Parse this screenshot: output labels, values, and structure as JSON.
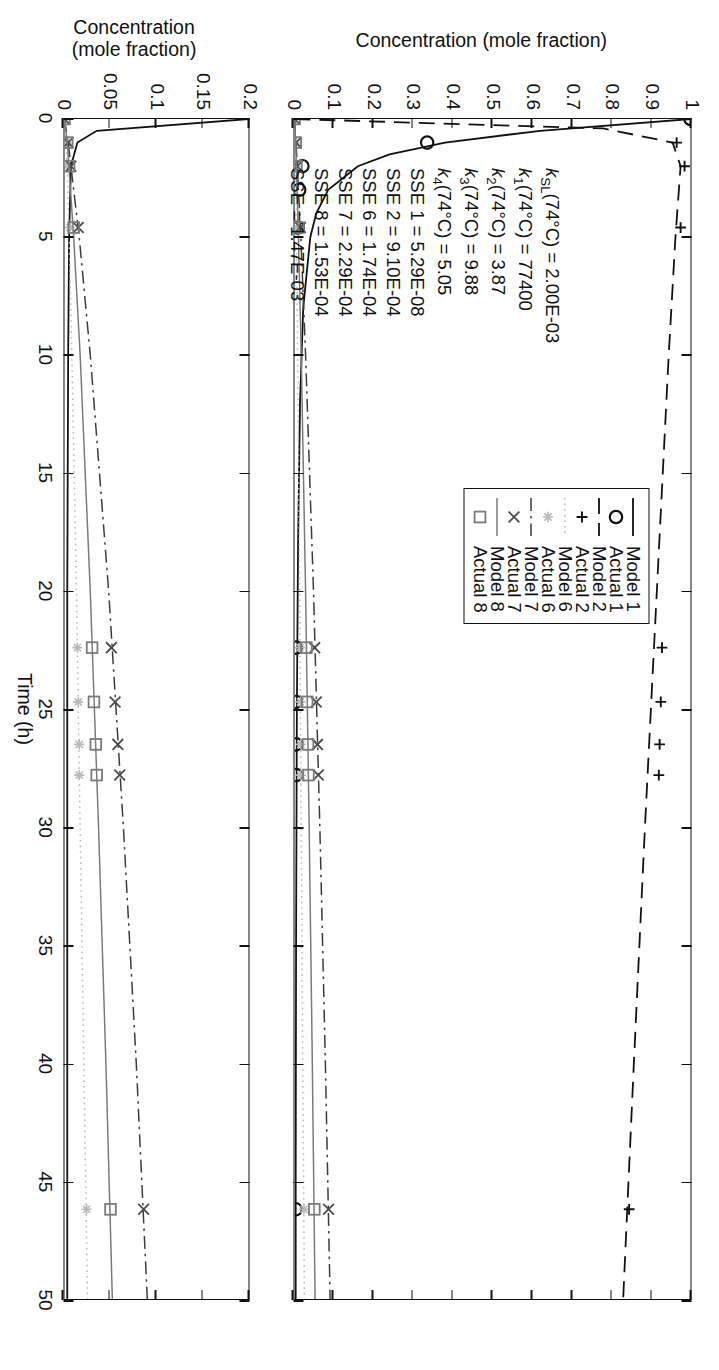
{
  "figure": {
    "xaxis_title": "Time (h)",
    "yaxis_title_top": "Concentration (mole fraction)",
    "yaxis_title_bottom_line1": "Concentration",
    "yaxis_title_bottom_line2": "(mole fraction)"
  },
  "legend": {
    "items": [
      {
        "label": "Model 1",
        "key": "solid-black-line"
      },
      {
        "label": "Actual 1",
        "key": "circle-marker"
      },
      {
        "label": "Model 2",
        "key": "dashed-line"
      },
      {
        "label": "Actual 2",
        "key": "plus-marker"
      },
      {
        "label": "Model 6",
        "key": "dotted-light-line"
      },
      {
        "label": "Actual 6",
        "key": "asterisk-marker"
      },
      {
        "label": "Model 7",
        "key": "dashdot-line"
      },
      {
        "label": "Actual 7",
        "key": "cross-marker"
      },
      {
        "label": "Model 8",
        "key": "solid-gray-line"
      },
      {
        "label": "Actual 8",
        "key": "square-marker"
      }
    ]
  },
  "annotation": {
    "lines": [
      {
        "symbol": "k",
        "sub": "SL",
        "rest": "(74°C) = 2.00E-03"
      },
      {
        "symbol": "k",
        "sub": "1",
        "rest": "(74°C) = 77400"
      },
      {
        "symbol": "k",
        "sub": "2",
        "rest": "(74°C) = 3.87"
      },
      {
        "symbol": "k",
        "sub": "3",
        "rest": "(74°C) = 9.88"
      },
      {
        "symbol": "k",
        "sub": "4",
        "rest": "(74°C) = 5.05"
      },
      {
        "symbol": "",
        "sub": "",
        "rest": "SSE 1 = 5.29E-08"
      },
      {
        "symbol": "",
        "sub": "",
        "rest": "SSE 2 = 9.10E-04"
      },
      {
        "symbol": "",
        "sub": "",
        "rest": "SSE 6 = 1.74E-04"
      },
      {
        "symbol": "",
        "sub": "",
        "rest": "SSE 7 = 2.29E-04"
      },
      {
        "symbol": "",
        "sub": "",
        "rest": "SSE 8 = 1.53E-04"
      },
      {
        "symbol": "",
        "sub": "",
        "rest": "SSE = 1.47E-03"
      }
    ]
  },
  "axes": {
    "x_ticks": [
      0,
      5,
      10,
      15,
      20,
      25,
      30,
      35,
      40,
      45,
      50
    ],
    "x_range": [
      0,
      50
    ],
    "y_ticks_top": [
      "0",
      "0.1",
      "0.2",
      "0.3",
      "0.4",
      "0.5",
      "0.6",
      "0.7",
      "0.8",
      "0.9",
      "1"
    ],
    "y_range_top": [
      0,
      1
    ],
    "y_ticks_bottom": [
      "0",
      "0.05",
      "0.1",
      "0.15",
      "0.2"
    ],
    "y_range_bottom": [
      0,
      0.2
    ]
  },
  "colors": {
    "ink": "#111111",
    "gray_mid": "#7a7a7a",
    "gray_light": "#b8b8b8",
    "axis": "#111111"
  },
  "chart_data": {
    "type": "line",
    "title": "",
    "xlabel": "Time (h)",
    "ylabel": "Concentration (mole fraction)",
    "xlim": [
      0,
      50
    ],
    "grid": false,
    "legend_position": "upper-center-right",
    "panels": [
      {
        "name": "top-panel",
        "ylim": [
          0,
          1
        ],
        "ylabel": "Concentration (mole fraction)",
        "series": [
          {
            "name": "Model 1",
            "style": "solid-black",
            "x": [
              0,
              0.5,
              1,
              1.5,
              2,
              3,
              4,
              5,
              8,
              12,
              18,
              25,
              35,
              45,
              50
            ],
            "y": [
              1.0,
              0.62,
              0.38,
              0.24,
              0.16,
              0.085,
              0.055,
              0.04,
              0.022,
              0.014,
              0.009,
              0.006,
              0.004,
              0.003,
              0.003
            ]
          },
          {
            "name": "Actual 1",
            "style": "circle-marker",
            "x": [
              0,
              1,
              2,
              3,
              4.6,
              22.4,
              24.7,
              26.5,
              27.8,
              46.2
            ],
            "y": [
              1.0,
              0.335,
              0.02,
              0.012,
              0.008,
              0.004,
              0.004,
              0.004,
              0.004,
              0.003
            ]
          },
          {
            "name": "Model 2",
            "style": "dashed-black",
            "x": [
              0,
              0.4,
              1,
              2,
              5,
              10,
              20,
              30,
              40,
              50
            ],
            "y": [
              0.0,
              0.78,
              0.955,
              0.975,
              0.962,
              0.945,
              0.915,
              0.885,
              0.857,
              0.83
            ]
          },
          {
            "name": "Actual 2",
            "style": "plus-marker",
            "x": [
              0,
              1,
              2,
              4.6,
              22.4,
              24.7,
              26.5,
              27.8,
              46.2
            ],
            "y": [
              0.0,
              0.965,
              0.985,
              0.975,
              0.928,
              0.925,
              0.922,
              0.92,
              0.845
            ]
          },
          {
            "name": "Model 6",
            "style": "dotted-light-gray",
            "x": [
              0,
              1,
              5,
              10,
              20,
              30,
              40,
              50
            ],
            "y": [
              0.0,
              0.002,
              0.005,
              0.008,
              0.013,
              0.017,
              0.021,
              0.025
            ]
          },
          {
            "name": "Actual 6",
            "style": "asterisk-marker",
            "x": [
              0,
              1,
              2,
              4.6,
              22.4,
              24.7,
              26.5,
              27.8,
              46.2
            ],
            "y": [
              0.0,
              0.002,
              0.003,
              0.006,
              0.014,
              0.015,
              0.016,
              0.016,
              0.024
            ]
          },
          {
            "name": "Model 7",
            "style": "dash-dot-black",
            "x": [
              0,
              1,
              5,
              10,
              20,
              30,
              40,
              50
            ],
            "y": [
              0.0,
              0.004,
              0.016,
              0.028,
              0.048,
              0.064,
              0.078,
              0.09
            ]
          },
          {
            "name": "Actual 7",
            "style": "cross-marker",
            "x": [
              0,
              1,
              2,
              4.6,
              22.4,
              24.7,
              26.5,
              27.8,
              46.2
            ],
            "y": [
              0.0,
              0.004,
              0.007,
              0.015,
              0.051,
              0.055,
              0.058,
              0.06,
              0.086
            ]
          },
          {
            "name": "Model 8",
            "style": "solid-gray",
            "x": [
              0,
              1,
              5,
              10,
              20,
              30,
              40,
              50
            ],
            "y": [
              0.0,
              0.003,
              0.01,
              0.017,
              0.028,
              0.037,
              0.045,
              0.052
            ]
          },
          {
            "name": "Actual 8",
            "style": "square-marker",
            "x": [
              0,
              1,
              2,
              4.6,
              22.4,
              24.7,
              26.5,
              27.8,
              46.2
            ],
            "y": [
              0.0,
              0.003,
              0.005,
              0.01,
              0.03,
              0.032,
              0.034,
              0.035,
              0.05
            ]
          }
        ]
      },
      {
        "name": "bottom-panel",
        "ylim": [
          0,
          0.2
        ],
        "ylabel": "Concentration (mole fraction)",
        "series": [
          {
            "name": "Model 1",
            "style": "solid-black",
            "x": [
              0,
              0.5,
              1,
              2,
              5,
              10,
              20,
              30,
              40,
              50
            ],
            "y": [
              0.2,
              0.035,
              0.014,
              0.007,
              0.005,
              0.004,
              0.003,
              0.003,
              0.003,
              0.003
            ]
          },
          {
            "name": "Model 6",
            "style": "dotted-light-gray",
            "x": [
              0,
              1,
              5,
              10,
              20,
              30,
              40,
              50
            ],
            "y": [
              0.0,
              0.002,
              0.005,
              0.008,
              0.013,
              0.017,
              0.021,
              0.025
            ]
          },
          {
            "name": "Actual 6",
            "style": "asterisk-marker",
            "x": [
              0,
              1,
              2,
              4.6,
              22.4,
              24.7,
              26.5,
              27.8,
              46.2
            ],
            "y": [
              0.0,
              0.002,
              0.003,
              0.006,
              0.014,
              0.015,
              0.016,
              0.016,
              0.024
            ]
          },
          {
            "name": "Model 7",
            "style": "dash-dot-black",
            "x": [
              0,
              1,
              5,
              10,
              20,
              30,
              40,
              50
            ],
            "y": [
              0.0,
              0.004,
              0.016,
              0.028,
              0.048,
              0.064,
              0.078,
              0.09
            ]
          },
          {
            "name": "Actual 7",
            "style": "cross-marker",
            "x": [
              0,
              1,
              2,
              4.6,
              22.4,
              24.7,
              26.5,
              27.8,
              46.2
            ],
            "y": [
              0.0,
              0.004,
              0.007,
              0.015,
              0.051,
              0.055,
              0.058,
              0.06,
              0.086
            ]
          },
          {
            "name": "Model 8",
            "style": "solid-gray",
            "x": [
              0,
              1,
              5,
              10,
              20,
              30,
              40,
              50
            ],
            "y": [
              0.0,
              0.003,
              0.01,
              0.017,
              0.028,
              0.037,
              0.045,
              0.052
            ]
          },
          {
            "name": "Actual 8",
            "style": "square-marker",
            "x": [
              0,
              1,
              2,
              4.6,
              22.4,
              24.7,
              26.5,
              27.8,
              46.2
            ],
            "y": [
              0.0,
              0.003,
              0.005,
              0.01,
              0.03,
              0.032,
              0.034,
              0.035,
              0.05
            ]
          }
        ]
      }
    ]
  }
}
